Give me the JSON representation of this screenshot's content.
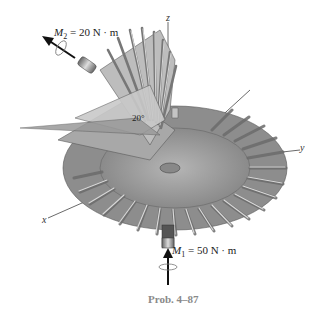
{
  "figure": {
    "caption": "Prob. 4–87",
    "moments": [
      {
        "symbol": "M",
        "subscript": "2",
        "value": "= 20 N · m",
        "direction": "up-left along gear shaft"
      },
      {
        "symbol": "M",
        "subscript": "1",
        "value": "= 50 N · m",
        "direction": "up along vertical shaft"
      }
    ],
    "angle_label": "20°",
    "axes": {
      "x": "x",
      "y": "y",
      "z": "z"
    },
    "colors": {
      "gear": "#9a9a9a",
      "gear_light": "#cfcfcf",
      "gear_dark": "#6e6e6e",
      "arrow": "#111111",
      "caption": "#8a8a8a"
    }
  }
}
